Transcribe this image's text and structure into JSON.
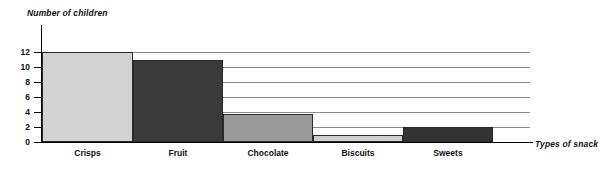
{
  "chart_data": {
    "type": "bar",
    "title": "",
    "ylabel": "Number of children",
    "xlabel": "Types of snack",
    "categories": [
      "Crisps",
      "Fruit",
      "Chocolate",
      "Biscuits",
      "Sweets"
    ],
    "values": [
      12,
      11,
      3.7,
      1,
      2
    ],
    "series": [
      {
        "name": "Number of children",
        "values": [
          12,
          11,
          3.7,
          1,
          2
        ]
      }
    ],
    "ylim": [
      0,
      12
    ],
    "yticks": [
      0,
      2,
      4,
      6,
      8,
      10,
      12
    ],
    "ytick_labels": [
      "0",
      "2",
      "4",
      "6",
      "8",
      "10",
      "12"
    ],
    "grid": true,
    "grid_axis": "y",
    "legend": false,
    "bar_colors": [
      "#d2d2d2",
      "#3a3a3a",
      "#9a9a9a",
      "#cfcfcf",
      "#333333"
    ],
    "bar_edge_color": "#2a2a2a",
    "gridline_color": "#8c8c8c",
    "axis_color": "#000000",
    "background_color": "#ffffff"
  },
  "axes": {
    "y_title": "Number of children",
    "x_title": "Types of snack"
  },
  "ticks": {
    "y": [
      "12",
      "10",
      "8",
      "6",
      "4",
      "2",
      "0"
    ]
  },
  "bars": [
    {
      "label": "Crisps",
      "value": "12"
    },
    {
      "label": "Fruit",
      "value": "11"
    },
    {
      "label": "Chocolate",
      "value": "3.7"
    },
    {
      "label": "Biscuits",
      "value": "1"
    },
    {
      "label": "Sweets",
      "value": "2"
    }
  ]
}
